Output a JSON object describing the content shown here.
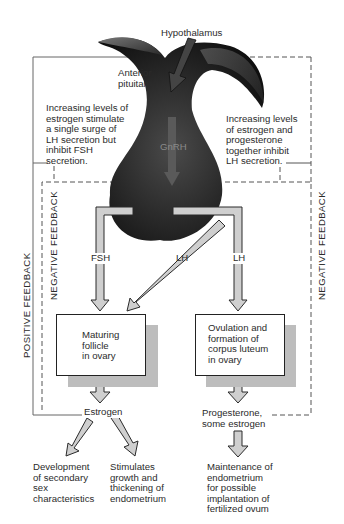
{
  "labels": {
    "hypothalamus": "Hypothalamus",
    "anterior_pituitary": "Anterior\npituitary",
    "gnrh": "GnRH",
    "left_note": "Increasing levels of\nestrogen stimulate\na single surge of\nLH secretion but\ninhibit FSH\nsecretion.",
    "right_note": "Increasing levels\nof estrogen and\nprogesterone\ntogether inhibit\nLH secretion.",
    "positive_feedback": "POSITIVE FEEDBACK",
    "negative_feedback_left": "NEGATIVE FEEDBACK",
    "negative_feedback_right": "NEGATIVE FEEDBACK",
    "fsh": "FSH",
    "lh_diagonal": "LH",
    "lh_right": "LH",
    "box_follicle": "Maturing\nfollicle\nin ovary",
    "box_ovulation": "Ovulation and\nformation of\ncorpus luteum\nin ovary",
    "estrogen": "Estrogen",
    "progesterone": "Progesterone,\nsome estrogen",
    "outcome_secondary_sex": "Development\nof secondary\nsex\ncharacteristics",
    "outcome_endometrium_growth": "Stimulates\ngrowth and\nthickening of\nendometrium",
    "outcome_maintenance": "Maintenance of\nendometrium\nfor possible\nimplantation of\nfertilized ovum"
  },
  "colors": {
    "pituitary_dark": "#1c1c1c",
    "arrow_fill": "#cfcfcf",
    "arrow_stroke": "#2a2a2a",
    "box_shadow": "#bdbdbd",
    "line": "#555555"
  }
}
